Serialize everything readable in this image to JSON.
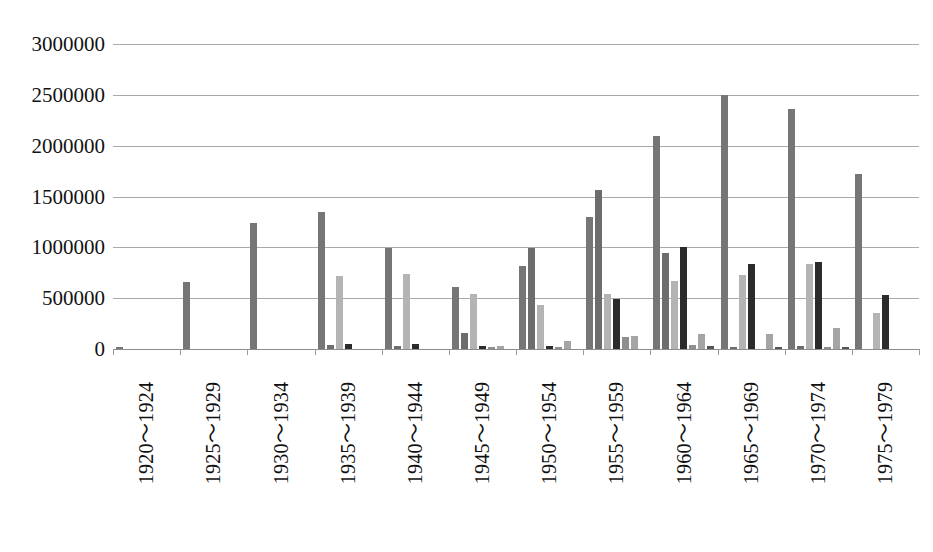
{
  "chart_data": {
    "type": "bar",
    "title": "",
    "subtitle": "",
    "xlabel": "",
    "ylabel": "",
    "ylim": [
      0,
      3000000
    ],
    "ytick_step": 500000,
    "yticks": [
      "3000000",
      "2500000",
      "2000000",
      "1500000",
      "1000000",
      "500000",
      "0"
    ],
    "grid": true,
    "legend": "none",
    "orientation": "vertical",
    "grouped": true,
    "categories": [
      "1920～1924",
      "1925～1929",
      "1930～1934",
      "1935～1939",
      "1940～1944",
      "1945～1949",
      "1950～1954",
      "1955～1959",
      "1960～1964",
      "1965～1969",
      "1970～1974",
      "1975～1979"
    ],
    "series": [
      {
        "name": "series-1",
        "color": "#767676",
        "values": [
          15000,
          660000,
          1240000,
          1350000,
          990000,
          610000,
          820000,
          1300000,
          2100000,
          2500000,
          2360000,
          1720000
        ]
      },
      {
        "name": "series-2",
        "color": "#6d6d6d",
        "values": [
          0,
          0,
          0,
          40000,
          30000,
          160000,
          990000,
          1560000,
          940000,
          20000,
          25000,
          0
        ]
      },
      {
        "name": "series-3",
        "color": "#b4b4b4",
        "values": [
          0,
          0,
          0,
          720000,
          740000,
          540000,
          430000,
          540000,
          670000,
          730000,
          840000,
          350000
        ]
      },
      {
        "name": "series-4",
        "color": "#2b2b2b",
        "values": [
          0,
          0,
          0,
          45000,
          45000,
          25000,
          30000,
          490000,
          1000000,
          840000,
          860000,
          530000
        ]
      },
      {
        "name": "series-5",
        "color": "#8f8f8f",
        "values": [
          0,
          0,
          0,
          0,
          0,
          20000,
          15000,
          120000,
          35000,
          0,
          15000,
          0
        ]
      },
      {
        "name": "series-6",
        "color": "#a5a5a5",
        "values": [
          0,
          0,
          0,
          0,
          0,
          30000,
          80000,
          130000,
          150000,
          150000,
          210000,
          0
        ]
      },
      {
        "name": "series-7",
        "color": "#555555",
        "values": [
          0,
          0,
          0,
          0,
          0,
          0,
          0,
          0,
          25000,
          20000,
          20000,
          0
        ]
      }
    ]
  },
  "axis": {
    "y_label_0": "3000000",
    "y_label_1": "2500000",
    "y_label_2": "2000000",
    "y_label_3": "1500000",
    "y_label_4": "1000000",
    "y_label_5": "500000",
    "y_label_6": "0"
  }
}
